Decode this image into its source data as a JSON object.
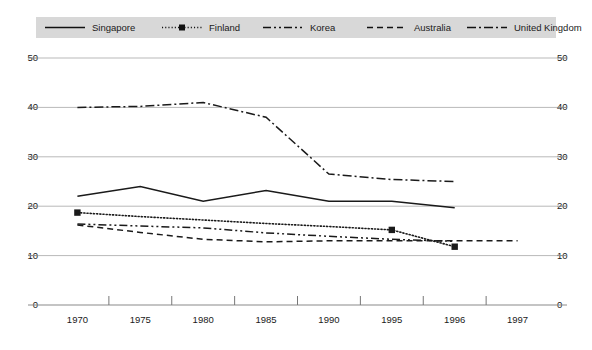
{
  "legend": {
    "position": "top",
    "background_color": "#d8d8d8",
    "entries": [
      {
        "label": "Singapore",
        "style": "solid",
        "marker": "none"
      },
      {
        "label": "Finland",
        "style": "dotted",
        "marker": "square"
      },
      {
        "label": "Korea",
        "style": "dash-dot-dot",
        "marker": "none"
      },
      {
        "label": "Australia",
        "style": "dashed",
        "marker": "none"
      },
      {
        "label": "United Kingdom",
        "style": "dash-dot",
        "marker": "none"
      }
    ]
  },
  "axes": {
    "y_left_ticks": [
      "50",
      "40",
      "30",
      "20",
      "10",
      "0"
    ],
    "y_right_ticks": [
      "50",
      "40",
      "30",
      "20",
      "10",
      "0"
    ],
    "x_ticks": [
      "1970",
      "1975",
      "1980",
      "1985",
      "1990",
      "1995",
      "1996",
      "1997"
    ]
  },
  "chart_data": {
    "type": "line",
    "title": "",
    "subtitle": "",
    "xlabel": "",
    "ylabel": "",
    "ylim": [
      0,
      50
    ],
    "ytick_values": [
      0,
      10,
      20,
      30,
      40,
      50
    ],
    "grid": true,
    "grid_axis": "y",
    "legend_position": "top",
    "categories": [
      "1970",
      "1975",
      "1980",
      "1985",
      "1990",
      "1995",
      "1996",
      "1997"
    ],
    "series": [
      {
        "name": "Singapore",
        "style": "solid",
        "marker": "none",
        "color": "#1a1a1a",
        "values": [
          22.0,
          24.0,
          21.0,
          23.2,
          21.0,
          21.0,
          19.7,
          null
        ]
      },
      {
        "name": "Finland",
        "style": "dotted",
        "marker": "square",
        "color": "#1a1a1a",
        "values": [
          18.7,
          17.9,
          17.2,
          16.5,
          15.9,
          15.2,
          11.8,
          null
        ],
        "marker_points": [
          "1970",
          "1995",
          "1996"
        ]
      },
      {
        "name": "Korea",
        "style": "dash-dot-dot",
        "marker": "none",
        "color": "#1a1a1a",
        "values": [
          16.4,
          16.0,
          15.6,
          14.6,
          13.9,
          13.3,
          12.9,
          null
        ]
      },
      {
        "name": "Australia",
        "style": "dashed",
        "marker": "none",
        "color": "#1a1a1a",
        "values": [
          16.2,
          14.7,
          13.3,
          12.8,
          13.0,
          13.0,
          13.0,
          13.0
        ]
      },
      {
        "name": "United Kingdom",
        "style": "dash-dot",
        "marker": "none",
        "color": "#1a1a1a",
        "values": [
          40.0,
          40.2,
          41.0,
          38.0,
          26.5,
          25.4,
          25.0,
          null
        ]
      }
    ]
  },
  "geometry": {
    "plot_left": 46,
    "plot_right": 549,
    "y_top_px": 58,
    "y_bottom_px": 305,
    "value_top": 50,
    "value_bottom": 0
  }
}
